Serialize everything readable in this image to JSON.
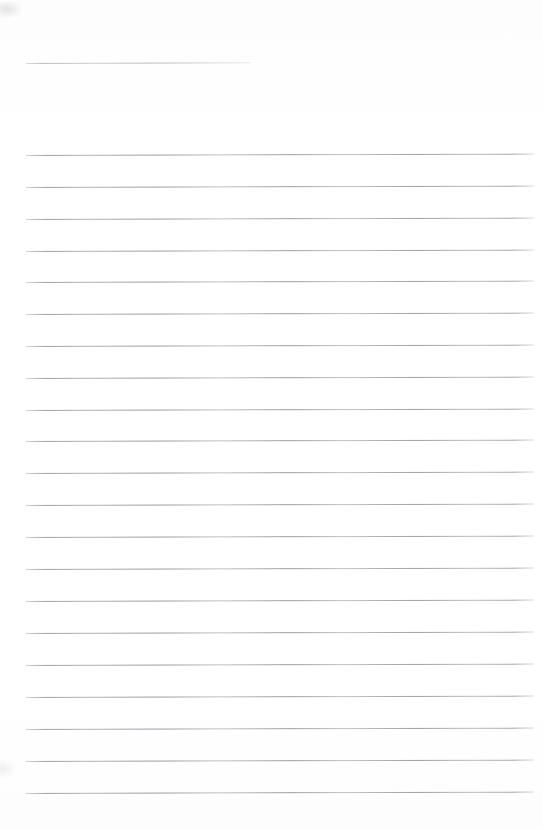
{
  "document": {
    "kind": "lined-notebook-page",
    "title_text": "",
    "body_text": "",
    "page_width": 543,
    "page_height": 829,
    "paper_color": "#ffffff",
    "rule_color": "#96969e",
    "is_blank": true
  },
  "layout": {
    "rule_left": 26,
    "rule_right": 534,
    "title_rule": {
      "x": 26,
      "y": 63,
      "width": 225
    },
    "body_rule": {
      "x": 26,
      "width": 508,
      "first_y": 155,
      "spacing": 31.9,
      "count": 21
    }
  },
  "rules": [
    {
      "name": "title-rule",
      "x": 26,
      "y": 63,
      "width": 225
    },
    {
      "name": "body-rule-1",
      "x": 26,
      "y": 155,
      "width": 508
    },
    {
      "name": "body-rule-2",
      "x": 26,
      "y": 187,
      "width": 508
    },
    {
      "name": "body-rule-3",
      "x": 26,
      "y": 219,
      "width": 508
    },
    {
      "name": "body-rule-4",
      "x": 26,
      "y": 251,
      "width": 508
    },
    {
      "name": "body-rule-5",
      "x": 26,
      "y": 282,
      "width": 508
    },
    {
      "name": "body-rule-6",
      "x": 26,
      "y": 314,
      "width": 508
    },
    {
      "name": "body-rule-7",
      "x": 26,
      "y": 346,
      "width": 508
    },
    {
      "name": "body-rule-8",
      "x": 26,
      "y": 378,
      "width": 508
    },
    {
      "name": "body-rule-9",
      "x": 26,
      "y": 410,
      "width": 508
    },
    {
      "name": "body-rule-10",
      "x": 26,
      "y": 441,
      "width": 508
    },
    {
      "name": "body-rule-11",
      "x": 26,
      "y": 473,
      "width": 508
    },
    {
      "name": "body-rule-12",
      "x": 26,
      "y": 505,
      "width": 508
    },
    {
      "name": "body-rule-13",
      "x": 26,
      "y": 537,
      "width": 508
    },
    {
      "name": "body-rule-14",
      "x": 26,
      "y": 569,
      "width": 508
    },
    {
      "name": "body-rule-15",
      "x": 26,
      "y": 601,
      "width": 508
    },
    {
      "name": "body-rule-16",
      "x": 26,
      "y": 633,
      "width": 508
    },
    {
      "name": "body-rule-17",
      "x": 26,
      "y": 665,
      "width": 508
    },
    {
      "name": "body-rule-18",
      "x": 26,
      "y": 697,
      "width": 508
    },
    {
      "name": "body-rule-19",
      "x": 26,
      "y": 729,
      "width": 508
    },
    {
      "name": "body-rule-20",
      "x": 26,
      "y": 761,
      "width": 508
    },
    {
      "name": "body-rule-21",
      "x": 26,
      "y": 793,
      "width": 508
    }
  ]
}
